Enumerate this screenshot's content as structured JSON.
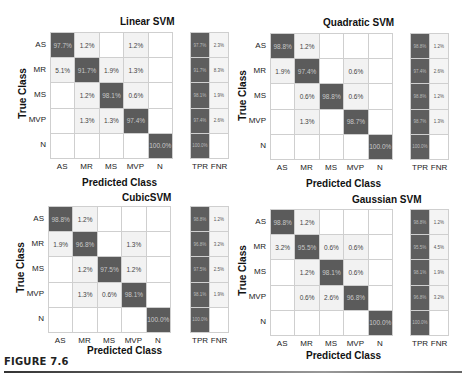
{
  "figure_caption": "FIGURE 7.6",
  "classes": [
    "AS",
    "MR",
    "MS",
    "MVP",
    "N"
  ],
  "side_labels": [
    "TPR",
    "FNR"
  ],
  "xlabel": "Predicted Class",
  "ylabel": "True Class",
  "colors": {
    "diagonal": "#5b5b5b",
    "off_diagonal": "#f2f2f2",
    "empty": "#ffffff",
    "grid": "#cfcfcf"
  },
  "chart_data": [
    {
      "type": "heatmap",
      "title": "Linear SVM",
      "xlabel": "Predicted Class",
      "ylabel": "True Class",
      "x_categories": [
        "AS",
        "MR",
        "MS",
        "MVP",
        "N"
      ],
      "y_categories": [
        "AS",
        "MR",
        "MS",
        "MVP",
        "N"
      ],
      "matrix": [
        [
          "97.7%",
          "1.2%",
          "",
          "1.2%",
          ""
        ],
        [
          "5.1%",
          "91.7%",
          "1.9%",
          "1.3%",
          ""
        ],
        [
          "",
          "1.2%",
          "98.1%",
          "0.6%",
          ""
        ],
        [
          "",
          "1.3%",
          "1.3%",
          "97.4%",
          ""
        ],
        [
          "",
          "",
          "",
          "",
          "100.0%"
        ]
      ],
      "tpr": [
        "97.7%",
        "91.7%",
        "98.1%",
        "97.4%",
        "100.0%"
      ],
      "fnr": [
        "2.3%",
        "8.3%",
        "1.9%",
        "2.6%",
        ""
      ]
    },
    {
      "type": "heatmap",
      "title": "Quadratic SVM",
      "xlabel": "Predicted Class",
      "ylabel": "True Class",
      "x_categories": [
        "AS",
        "MR",
        "MS",
        "MVP",
        "N"
      ],
      "y_categories": [
        "AS",
        "MR",
        "MS",
        "MVP",
        "N"
      ],
      "matrix": [
        [
          "98.8%",
          "1.2%",
          "",
          "",
          ""
        ],
        [
          "1.9%",
          "97.4%",
          "",
          "0.6%",
          ""
        ],
        [
          "",
          "0.6%",
          "98.8%",
          "0.6%",
          ""
        ],
        [
          "",
          "1.3%",
          "",
          "98.7%",
          ""
        ],
        [
          "",
          "",
          "",
          "",
          "100.0%"
        ]
      ],
      "tpr": [
        "98.8%",
        "97.4%",
        "98.8%",
        "98.7%",
        "100.0%"
      ],
      "fnr": [
        "1.2%",
        "2.6%",
        "1.2%",
        "1.3%",
        ""
      ]
    },
    {
      "type": "heatmap",
      "title": "CubicSVM",
      "xlabel": "Predicted Class",
      "ylabel": "True Class",
      "x_categories": [
        "AS",
        "MR",
        "MS",
        "MVP",
        "N"
      ],
      "y_categories": [
        "AS",
        "MR",
        "MS",
        "MVP",
        "N"
      ],
      "matrix": [
        [
          "98.8%",
          "1.2%",
          "",
          "",
          ""
        ],
        [
          "1.9%",
          "96.8%",
          "",
          "1.3%",
          ""
        ],
        [
          "",
          "1.2%",
          "97.5%",
          "1.2%",
          ""
        ],
        [
          "",
          "1.3%",
          "0.6%",
          "98.1%",
          ""
        ],
        [
          "",
          "",
          "",
          "",
          "100.0%"
        ]
      ],
      "tpr": [
        "98.8%",
        "96.8%",
        "97.5%",
        "98.1%",
        "100.0%"
      ],
      "fnr": [
        "1.2%",
        "3.2%",
        "2.5%",
        "1.9%",
        ""
      ]
    },
    {
      "type": "heatmap",
      "title": "Gaussian SVM",
      "xlabel": "Predicted Class",
      "ylabel": "True Class",
      "x_categories": [
        "AS",
        "MR",
        "MS",
        "MVP",
        "N"
      ],
      "y_categories": [
        "AS",
        "MR",
        "MS",
        "MVP",
        "N"
      ],
      "matrix": [
        [
          "98.8%",
          "1.2%",
          "",
          "",
          ""
        ],
        [
          "3.2%",
          "95.5%",
          "0.6%",
          "0.6%",
          ""
        ],
        [
          "",
          "1.2%",
          "98.1%",
          "0.6%",
          ""
        ],
        [
          "",
          "0.6%",
          "2.6%",
          "96.8%",
          ""
        ],
        [
          "",
          "",
          "",
          "",
          "100.0%"
        ]
      ],
      "tpr": [
        "98.8%",
        "95.5%",
        "98.1%",
        "96.8%",
        "100.0%"
      ],
      "fnr": [
        "1.2%",
        "4.5%",
        "1.9%",
        "3.2%",
        ""
      ]
    }
  ]
}
